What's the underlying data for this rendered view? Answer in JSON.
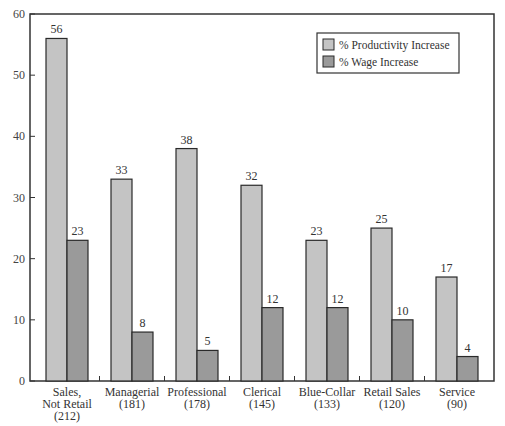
{
  "chart_data": {
    "type": "bar",
    "title": "",
    "xlabel": "",
    "ylabel": "",
    "ylim": [
      0,
      60
    ],
    "yticks": [
      0,
      10,
      20,
      30,
      40,
      50,
      60
    ],
    "grid": false,
    "legend_position": "upper right",
    "categories": [
      "Sales, Not Retail (212)",
      "Managerial (181)",
      "Professional (178)",
      "Clerical (145)",
      "Blue-Collar (133)",
      "Retail Sales (120)",
      "Service (90)"
    ],
    "category_lines": [
      [
        "Sales,",
        "Not Retail",
        "(212)"
      ],
      [
        "Managerial",
        "(181)"
      ],
      [
        "Professional",
        "(178)"
      ],
      [
        "Clerical",
        "(145)"
      ],
      [
        "Blue-Collar",
        "(133)"
      ],
      [
        "Retail Sales",
        "(120)"
      ],
      [
        "Service",
        "(90)"
      ]
    ],
    "series": [
      {
        "name": "% Productivity Increase",
        "color": "#c4c4c4",
        "values": [
          56,
          33,
          38,
          32,
          23,
          25,
          17
        ]
      },
      {
        "name": "% Wage Increase",
        "color": "#9a9a9a",
        "values": [
          23,
          8,
          5,
          12,
          12,
          10,
          4
        ]
      }
    ]
  }
}
